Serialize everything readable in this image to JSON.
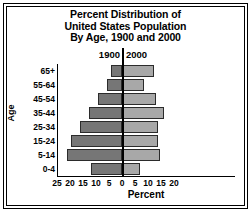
{
  "chart_data": {
    "type": "bar",
    "subtype": "population-pyramid",
    "title": [
      "Percent Distribution of",
      "United States Population",
      "By Age, 1900 and 2000"
    ],
    "title_text": "Percent Distribution of United States Population By Age, 1900 and 2000",
    "xlabel": "Percent",
    "ylabel": "Age",
    "categories": [
      "0-4",
      "5-14",
      "15-24",
      "25-34",
      "35-44",
      "45-54",
      "55-64",
      "65+"
    ],
    "categories_top_to_bottom": [
      "65+",
      "55-64",
      "45-54",
      "35-44",
      "25-34",
      "15-24",
      "5-14",
      "0-4"
    ],
    "series": [
      {
        "name": "1900",
        "side": "left",
        "color": "#767676",
        "values": [
          12.1,
          21.3,
          19.6,
          16.2,
          12.6,
          9.1,
          5.7,
          4.1
        ]
      },
      {
        "name": "2000",
        "side": "right",
        "color": "#a8a8a8",
        "values": [
          6.8,
          14.6,
          13.9,
          13.9,
          16.2,
          13.2,
          8.6,
          12.4
        ]
      }
    ],
    "xticks_left": [
      25,
      20,
      15,
      10,
      5
    ],
    "xtick_center": 0,
    "xticks_right": [
      5,
      10,
      15,
      20
    ],
    "xtick_labels": [
      "25",
      "20",
      "15",
      "10",
      "5",
      "0",
      "5",
      "10",
      "15",
      "20"
    ],
    "xlim_left": 25,
    "xlim_right": 20,
    "grid": false,
    "legend_position": "top-center"
  },
  "legend": {
    "left_label": "1900",
    "right_label": "2000"
  },
  "axes": {
    "y_title": "Age",
    "x_title": "Percent"
  }
}
